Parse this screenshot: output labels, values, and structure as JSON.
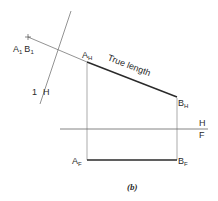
{
  "diagram": {
    "caption": "(b)",
    "labels": {
      "a1b1": {
        "a": "A",
        "a_sub": "1",
        "b": "B",
        "b_sub": "1"
      },
      "one_h": {
        "one": "1",
        "slash": "/",
        "h": "H"
      },
      "a_h": {
        "main": "A",
        "sub": "H"
      },
      "b_h": {
        "main": "B",
        "sub": "H"
      },
      "a_f": {
        "main": "A",
        "sub": "F"
      },
      "b_f": {
        "main": "B",
        "sub": "F"
      },
      "fold_h": "H",
      "fold_f": "F",
      "true_length": "True length"
    },
    "colors": {
      "line": "#555555",
      "thick_line": "#2a2a2a",
      "text": "#2a2a2a"
    }
  }
}
